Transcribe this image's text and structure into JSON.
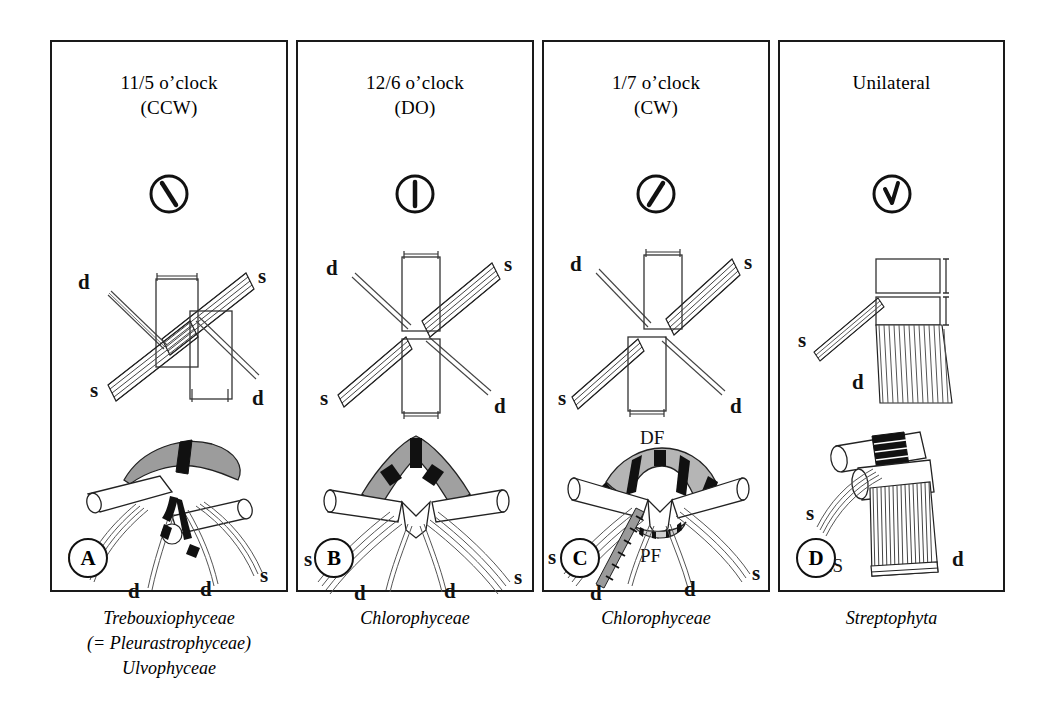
{
  "figure": {
    "background_color": "#ffffff",
    "line_color": "#1a1a1a",
    "shading_color": "#9a9a9a"
  },
  "panels": [
    {
      "id": "A",
      "badge": "A",
      "title_line1": "11/5 o’clock",
      "title_line2": "(CCW)",
      "clock_icon": "clock-backslash-icon",
      "clock_angle_deg": 160,
      "top_diagram": {
        "name": "basal-body-offset-counterclockwise",
        "labels": [
          "d",
          "s",
          "s",
          "d"
        ]
      },
      "bottom_diagram": {
        "name": "flagellar-apparatus-3d-ccw",
        "labels": [
          "s",
          "d",
          "d",
          "s"
        ]
      },
      "caption_lines": [
        "Trebouxiophyceae",
        "(= Pleurastrophyceae)",
        "Ulvophyceae"
      ]
    },
    {
      "id": "B",
      "badge": "B",
      "title_line1": "12/6 o’clock",
      "title_line2": "(DO)",
      "clock_icon": "clock-vertical-icon",
      "clock_angle_deg": 180,
      "top_diagram": {
        "name": "basal-body-directly-opposed",
        "labels": [
          "d",
          "s",
          "s",
          "d"
        ]
      },
      "bottom_diagram": {
        "name": "flagellar-apparatus-3d-do",
        "labels": [
          "s",
          "d",
          "d",
          "s"
        ]
      },
      "caption_lines": [
        "Chlorophyceae"
      ]
    },
    {
      "id": "C",
      "badge": "C",
      "title_line1": "1/7 o’clock",
      "title_line2": "(CW)",
      "clock_icon": "clock-slash-icon",
      "clock_angle_deg": 200,
      "top_diagram": {
        "name": "basal-body-offset-clockwise",
        "labels": [
          "d",
          "s",
          "s",
          "d"
        ]
      },
      "bottom_diagram": {
        "name": "flagellar-apparatus-3d-cw",
        "labels": [
          "DF",
          "PF",
          "s",
          "d",
          "d",
          "s"
        ]
      },
      "caption_lines": [
        "Chlorophyceae"
      ]
    },
    {
      "id": "D",
      "badge": "D",
      "title_line1": "Unilateral",
      "title_line2": "",
      "clock_icon": "clock-vee-icon",
      "clock_angle_deg": 195,
      "top_diagram": {
        "name": "basal-body-unilateral",
        "labels": [
          "s",
          "d"
        ]
      },
      "bottom_diagram": {
        "name": "multilayered-structure-3d",
        "labels": [
          "s",
          "MLS",
          "d"
        ]
      },
      "caption_lines": [
        "Streptophyta"
      ]
    }
  ],
  "legend_terms": {
    "d": "d",
    "s": "s",
    "DF": "DF",
    "PF": "PF",
    "MLS": "MLS"
  }
}
